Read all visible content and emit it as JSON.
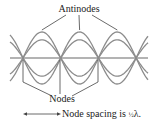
{
  "diagram": {
    "antinodes_label": "Antinodes",
    "nodes_label": "Nodes",
    "caption_prefix": "Node spacing is ",
    "caption_fraction": "½",
    "caption_suffix": "λ.",
    "node_count": 4,
    "antinode_count": 3,
    "amplitudes_relative": [
      1.0,
      0.7,
      -0.7,
      -1.0
    ],
    "colors": {
      "wave": "#8c8c8c",
      "axis": "#9a9a9a",
      "leader": "#444444",
      "text": "#222222"
    }
  }
}
